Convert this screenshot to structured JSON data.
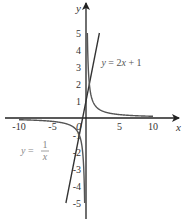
{
  "chart_data": {
    "type": "line",
    "title": "",
    "xlabel": "x",
    "ylabel": "y",
    "xlim": [
      -12,
      13.5
    ],
    "ylim": [
      -6.2,
      7
    ],
    "xticks": [
      -10,
      -5,
      5,
      10
    ],
    "xtick_labels": [
      "-10",
      "-5",
      "5",
      "10"
    ],
    "yticks": [
      1,
      2,
      3,
      4,
      5,
      -1,
      -2,
      -3,
      -4,
      -5
    ],
    "ytick_labels": [
      "1",
      "2",
      "3",
      "4",
      "5",
      "-1",
      "-2",
      "-3",
      "-4",
      "-5"
    ],
    "origin_label": "0",
    "grid": false,
    "series": [
      {
        "name": "y = 2x + 1",
        "function": "2x+1",
        "x_range": [
          -3,
          2
        ],
        "color": "#333333"
      },
      {
        "name": "y = 1/x (positive branch)",
        "function": "1/x",
        "x_range": [
          0.2,
          10
        ],
        "color": "#555555"
      },
      {
        "name": "y = 1/x (negative branch)",
        "function": "1/x",
        "x_range": [
          -10,
          -0.2
        ],
        "color": "#555555"
      }
    ],
    "annotations": [
      {
        "text_parts": [
          "y",
          " = 2",
          "x",
          " + 1"
        ],
        "anchor": [
          2,
          3.3
        ],
        "color": "#555555"
      },
      {
        "text_parts": [
          "y",
          " = ",
          "1",
          "x"
        ],
        "anchor": [
          -9.8,
          -1.7
        ],
        "color": "#888888",
        "fraction": true
      }
    ]
  }
}
